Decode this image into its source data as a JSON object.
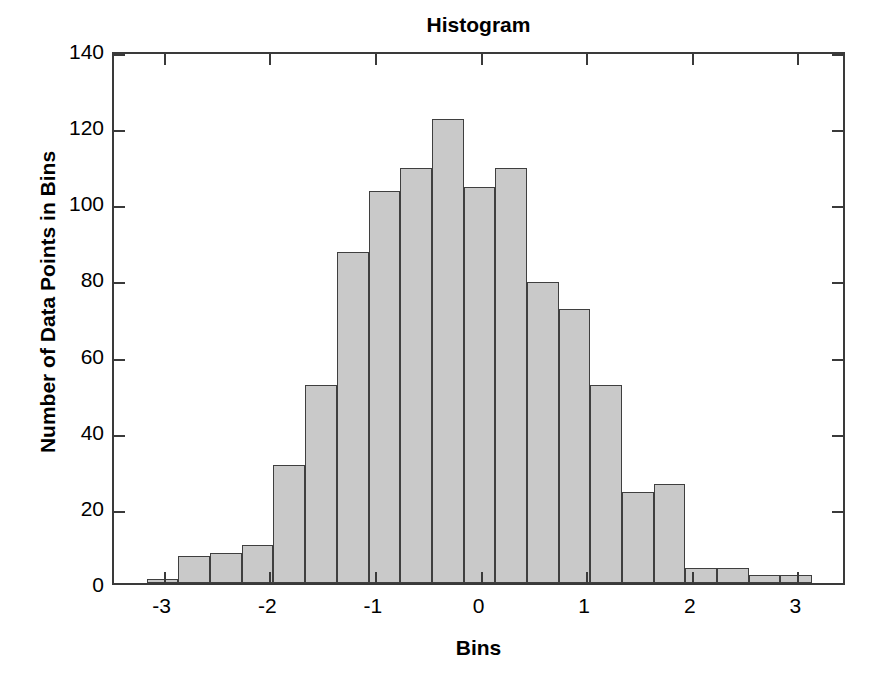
{
  "figure": {
    "background": "#ffffff",
    "axis_color": "#3a3a3a"
  },
  "chart_data": {
    "type": "bar",
    "title": "Histogram",
    "xlabel": "Bins",
    "ylabel": "Number of Data Points in Bins",
    "xlim": [
      -3.47,
      3.47
    ],
    "ylim": [
      0,
      140
    ],
    "grid": false,
    "legend": null,
    "bar_color": "#c9c9c9",
    "bar_edge_color": "#3f3f3f",
    "bin_width": 0.3,
    "xticks": [
      -3,
      -2,
      -1,
      0,
      1,
      2,
      3
    ],
    "xticklabels": [
      "-3",
      "-2",
      "-1",
      "0",
      "1",
      "2",
      "3"
    ],
    "yticks": [
      0,
      20,
      40,
      60,
      80,
      100,
      120,
      140
    ],
    "yticklabels": [
      "0",
      "20",
      "40",
      "60",
      "80",
      "100",
      "120",
      "140"
    ],
    "bin_edges": [
      -3.16,
      -2.86,
      -2.56,
      -2.26,
      -1.96,
      -1.66,
      -1.36,
      -1.06,
      -0.76,
      -0.46,
      -0.16,
      0.14,
      0.44,
      0.74,
      1.04,
      1.34,
      1.64,
      1.94,
      2.24,
      2.54,
      2.84,
      3.14,
      3.44
    ],
    "bin_centers": [
      -3.01,
      -2.71,
      -2.41,
      -2.11,
      -1.81,
      -1.51,
      -1.21,
      -0.91,
      -0.61,
      -0.31,
      -0.01,
      0.29,
      0.59,
      0.89,
      1.19,
      1.49,
      1.79,
      2.09,
      2.39,
      2.69,
      2.99,
      3.29
    ],
    "values": [
      1,
      7,
      8,
      10,
      31,
      52,
      87,
      103,
      109,
      122,
      104,
      109,
      79,
      72,
      52,
      24,
      26,
      4,
      4,
      2,
      2,
      0
    ]
  }
}
